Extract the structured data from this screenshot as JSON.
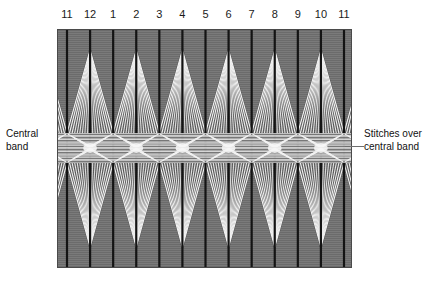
{
  "figure": {
    "type": "textile-stitch-diagram",
    "background_color": "#ffffff",
    "panel": {
      "ground_color": "#6b6b6b",
      "warp_line_color": "#141414",
      "stitch_color": "#f2f2f2",
      "stitch_shadow_color": "#bdbdbd",
      "central_band_color": "#c9c9c9",
      "x": 57,
      "y": 29,
      "width": 295,
      "height": 239,
      "central_band_top": 104,
      "central_band_height": 30
    },
    "column_labels": [
      "11",
      "12",
      "1",
      "2",
      "3",
      "4",
      "5",
      "6",
      "7",
      "8",
      "9",
      "10",
      "11"
    ],
    "column_count": 13,
    "annotations": [
      {
        "id": "central-band",
        "text": "Central\nband",
        "side": "left"
      },
      {
        "id": "stitches-over-central-band",
        "text": "Stitches over\ncentral band",
        "side": "right"
      }
    ],
    "annotation_left_text": "Central\nband",
    "annotation_right_text": "Stitches over\ncentral band"
  }
}
